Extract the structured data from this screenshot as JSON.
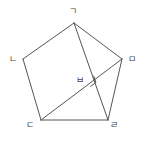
{
  "figure": {
    "kind": "geometry-diagram",
    "stroke_color": "#555555",
    "background_color": "#ffffff",
    "label_color": "#444444",
    "stroke_width": 1,
    "canvas": {
      "width": 145,
      "height": 142
    },
    "vertices": [
      {
        "id": "g",
        "label": "ㄱ",
        "x": 74,
        "y": 23,
        "label_x": 69,
        "label_y": 7,
        "name": "vertex-giyeok"
      },
      {
        "id": "n",
        "label": "ㄴ",
        "x": 23,
        "y": 59,
        "label_x": 9,
        "label_y": 55,
        "name": "vertex-nieun"
      },
      {
        "id": "d",
        "label": "ㄷ",
        "x": 41,
        "y": 120,
        "label_x": 26,
        "label_y": 121,
        "name": "vertex-digeut"
      },
      {
        "id": "r",
        "label": "ㄹ",
        "x": 108,
        "y": 120,
        "label_x": 110,
        "label_y": 121,
        "name": "vertex-rieul"
      },
      {
        "id": "m",
        "label": "ㅁ",
        "x": 122,
        "y": 59,
        "label_x": 128,
        "label_y": 55,
        "name": "vertex-mieum"
      },
      {
        "id": "b",
        "label": "ㅂ",
        "x": 88,
        "y": 80,
        "label_x": 76,
        "label_y": 76,
        "name": "intersection-bieup"
      }
    ],
    "edges": [
      {
        "from": "g",
        "to": "n",
        "name": "edge-giyeok-nieun"
      },
      {
        "from": "n",
        "to": "d",
        "name": "edge-nieun-digeut"
      },
      {
        "from": "d",
        "to": "r",
        "name": "edge-digeut-rieul"
      },
      {
        "from": "r",
        "to": "m",
        "name": "edge-rieul-mieum"
      },
      {
        "from": "m",
        "to": "g",
        "name": "edge-mieum-giyeok"
      }
    ],
    "diagonals": [
      {
        "from": "g",
        "to": "r",
        "name": "diagonal-giyeok-rieul"
      },
      {
        "from": "d",
        "to": "m",
        "name": "diagonal-digeut-mieum"
      }
    ],
    "right_angle_mark": {
      "at": "b",
      "size": 7,
      "name": "right-angle-mark"
    }
  }
}
